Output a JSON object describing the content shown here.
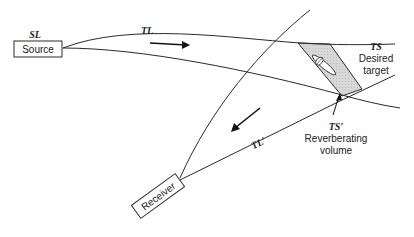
{
  "diagram": {
    "nodes": {
      "source": {
        "label": "Source",
        "sublabel": "SL"
      },
      "receiver": {
        "label": "Receiver"
      }
    },
    "paths": {
      "outgoing": {
        "label": "TL"
      },
      "return": {
        "label": "TL′"
      }
    },
    "targets": {
      "desired": {
        "code": "TS",
        "line1": "Desired",
        "line2": "target"
      },
      "reverberating": {
        "code": "TS′",
        "line1": "Reverberating",
        "line2": "volume"
      }
    },
    "colors": {
      "line": "#2a2a2a",
      "shaded_region": "#d4d4d4",
      "background": "#ffffff"
    }
  }
}
